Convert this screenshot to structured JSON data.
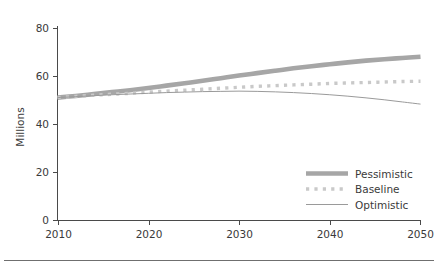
{
  "chart_data": {
    "type": "line",
    "title": "",
    "subtitle": "",
    "xlabel": "",
    "ylabel": "Millions",
    "xlim": [
      2010,
      2050
    ],
    "ylim": [
      0,
      80
    ],
    "grid": false,
    "legend_position": "bottom-right",
    "x_ticks": [
      "2010",
      "2020",
      "2030",
      "2040",
      "2050"
    ],
    "x_tick_values": [
      2010,
      2020,
      2030,
      2040,
      2050
    ],
    "y_ticks": [
      "0",
      "20",
      "40",
      "60",
      "80"
    ],
    "y_tick_values": [
      0,
      20,
      40,
      60,
      80
    ],
    "x": [
      2010,
      2012,
      2014,
      2016,
      2018,
      2020,
      2022,
      2024,
      2026,
      2028,
      2030,
      2032,
      2034,
      2036,
      2038,
      2040,
      2042,
      2044,
      2046,
      2048,
      2050
    ],
    "series": [
      {
        "name": "Pessimistic",
        "style": "thick-solid",
        "color": "#a6a6a6",
        "values": [
          51.2,
          51.9,
          52.7,
          53.5,
          54.3,
          55.2,
          56.2,
          57.2,
          58.2,
          59.3,
          60.4,
          61.4,
          62.4,
          63.4,
          64.3,
          65.1,
          65.9,
          66.6,
          67.2,
          67.7,
          68.2
        ]
      },
      {
        "name": "Baseline",
        "style": "dotted",
        "color": "#c9c9c9",
        "values": [
          51.2,
          51.7,
          52.2,
          52.6,
          53.0,
          53.5,
          53.9,
          54.3,
          54.7,
          55.1,
          55.5,
          55.9,
          56.2,
          56.5,
          56.8,
          57.1,
          57.3,
          57.5,
          57.7,
          57.9,
          58.0
        ]
      },
      {
        "name": "Optimistic",
        "style": "thin-solid",
        "color": "#9a9a9a",
        "values": [
          51.2,
          51.6,
          52.0,
          52.4,
          52.7,
          53.0,
          53.3,
          53.5,
          53.7,
          53.8,
          53.9,
          53.8,
          53.6,
          53.3,
          52.9,
          52.4,
          51.8,
          51.1,
          50.3,
          49.4,
          48.5
        ]
      }
    ]
  },
  "legend": {
    "items": [
      {
        "label": "Pessimistic",
        "swatch": "thick-solid-line-swatch"
      },
      {
        "label": "Baseline",
        "swatch": "dotted-line-swatch"
      },
      {
        "label": "Optimistic",
        "swatch": "thin-solid-line-swatch"
      }
    ]
  },
  "colors": {
    "pessimistic": "#a6a6a6",
    "baseline": "#c9c9c9",
    "optimistic": "#9a9a9a",
    "axis": "#4a4a4a",
    "text": "#3a3a3a",
    "footer_rule": "#6f6f6f",
    "background": "#ffffff"
  }
}
